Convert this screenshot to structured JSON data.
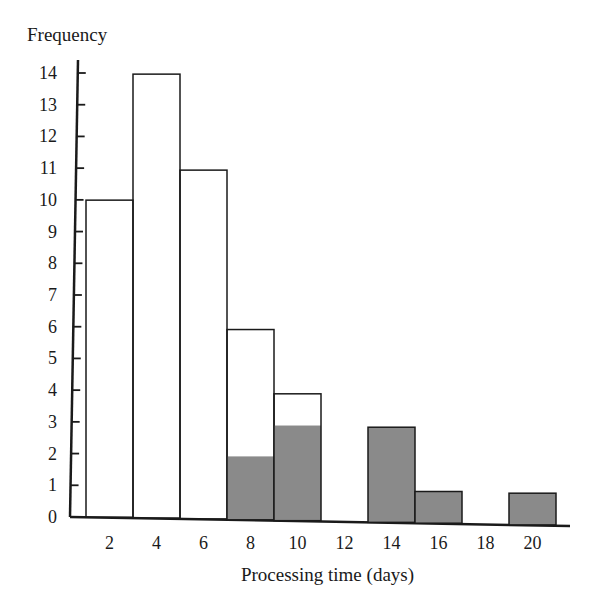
{
  "chart_data": {
    "type": "bar",
    "subtype": "histogram",
    "title": "",
    "xlabel": "Processing time (days)",
    "ylabel": "Frequency",
    "categories": [
      "2",
      "4",
      "6",
      "8",
      "10",
      "12",
      "14",
      "16",
      "18",
      "20"
    ],
    "series": [
      {
        "name": "total",
        "fill": "#ffffff",
        "values": [
          10,
          14,
          11,
          6,
          4,
          0,
          3,
          1,
          0,
          1
        ]
      },
      {
        "name": "shaded",
        "fill": "#8a8a8a",
        "values": [
          0,
          0,
          0,
          2,
          3,
          0,
          3,
          1,
          0,
          1
        ]
      }
    ],
    "ylim": [
      0,
      14
    ],
    "yticks": [
      0,
      1,
      2,
      3,
      4,
      5,
      6,
      7,
      8,
      9,
      10,
      11,
      12,
      13,
      14
    ],
    "grid": false,
    "legend": null
  },
  "colors": {
    "shade": "#8a8a8a",
    "outline": "#1a1a1a"
  }
}
